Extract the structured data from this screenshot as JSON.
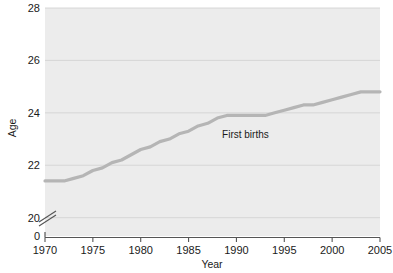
{
  "chart_data": {
    "type": "line",
    "title": "",
    "subtitle": "",
    "xlabel": "Year",
    "ylabel": "Age",
    "xlim": [
      1970,
      2005
    ],
    "ylim": [
      19.3,
      28
    ],
    "y_axis_break": true,
    "y_axis_break_symbol": "//",
    "y_origin_label": "0",
    "grid": "horizontal",
    "legend": "inline-annotation",
    "xticks": [
      1970,
      1975,
      1980,
      1985,
      1990,
      1995,
      2000,
      2005
    ],
    "xtick_labels": [
      "1970",
      "1975",
      "1980",
      "1985",
      "1990",
      "1995",
      "2000",
      "2005"
    ],
    "yticks": [
      20,
      22,
      24,
      26,
      28
    ],
    "ytick_labels": [
      "20",
      "22",
      "24",
      "26",
      "28"
    ],
    "series": [
      {
        "name": "First births",
        "color": "#b5b5b5",
        "annotation": "First births",
        "annotation_x": 1988.5,
        "annotation_y": 23.05,
        "x": [
          1970,
          1971,
          1972,
          1973,
          1974,
          1975,
          1976,
          1977,
          1978,
          1979,
          1980,
          1981,
          1982,
          1983,
          1984,
          1985,
          1986,
          1987,
          1988,
          1989,
          1990,
          1991,
          1992,
          1993,
          1994,
          1995,
          1996,
          1997,
          1998,
          1999,
          2000,
          2001,
          2002,
          2003,
          2004,
          2005
        ],
        "values": [
          21.4,
          21.4,
          21.4,
          21.5,
          21.6,
          21.8,
          21.9,
          22.1,
          22.2,
          22.4,
          22.6,
          22.7,
          22.9,
          23.0,
          23.2,
          23.3,
          23.5,
          23.6,
          23.8,
          23.9,
          23.9,
          23.9,
          23.9,
          23.9,
          24.0,
          24.1,
          24.2,
          24.3,
          24.3,
          24.4,
          24.5,
          24.6,
          24.7,
          24.8,
          24.8,
          24.8
        ]
      }
    ]
  },
  "axis": {
    "y_label": "Age",
    "x_label": "Year",
    "zero_label": "0",
    "y_ticks": [
      "28",
      "26",
      "24",
      "22",
      "20"
    ],
    "x_ticks": [
      "1970",
      "1975",
      "1980",
      "1985",
      "1990",
      "1995",
      "2000",
      "2005"
    ]
  },
  "annotations": {
    "first_births": "First births"
  },
  "colors": {
    "plot_background": "#ececec",
    "page_background": "#ffffff",
    "gridline": "#d4d4d4",
    "series_line": "#b5b5b5",
    "axis_line": "#555555",
    "text": "#1a1a1a"
  }
}
